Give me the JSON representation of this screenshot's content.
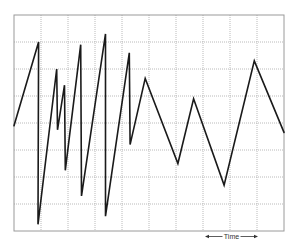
{
  "chart_data": {
    "type": "line",
    "title": "",
    "xlabel": "Time",
    "ylabel": "",
    "grid": true,
    "legend": null,
    "x_divisions": 10,
    "y_divisions": 8,
    "xlim": [
      0,
      10
    ],
    "ylim": [
      0,
      8
    ],
    "annotations": [
      {
        "text": "Time",
        "type": "double-arrow",
        "span_x": [
          7,
          9
        ]
      }
    ],
    "series": [
      {
        "name": "signal",
        "x": [
          0.0,
          0.91,
          0.89,
          1.58,
          1.61,
          1.87,
          1.9,
          2.47,
          2.5,
          3.39,
          3.39,
          4.27,
          4.3,
          4.86,
          6.07,
          6.65,
          7.78,
          8.9,
          10.0
        ],
        "y": [
          3.9,
          7.0,
          0.25,
          6.0,
          3.75,
          5.4,
          2.25,
          6.9,
          1.3,
          7.3,
          0.55,
          6.6,
          3.2,
          5.65,
          2.5,
          4.9,
          1.7,
          6.3,
          3.65
        ]
      }
    ],
    "colors": {
      "trace": "#1a1a1a",
      "grid": "#a8a8a8",
      "frame": "#9a9a9a"
    }
  }
}
